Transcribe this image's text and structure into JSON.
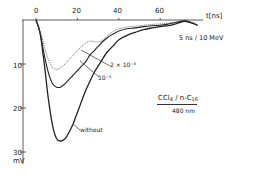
{
  "chart_data": {
    "type": "line",
    "title": "",
    "xlabel": "t[ns]",
    "ylabel": "mV",
    "x_ticks": [
      "0",
      "20",
      "40",
      "60"
    ],
    "y_ticks": [
      "10",
      "20",
      "30"
    ],
    "xlim": [
      -3,
      100
    ],
    "ylim": [
      0,
      31
    ],
    "y_inverted": true,
    "grid": false,
    "annotations": {
      "scale": "5 ns / 10 MeV",
      "system_line1": "CCl4 / n-C16",
      "system_line2": "480 nm"
    },
    "series": [
      {
        "name": "without",
        "style": "solid-thick",
        "x": [
          0,
          2,
          4,
          6,
          8,
          10,
          12,
          14,
          16,
          18,
          20,
          22,
          24,
          26,
          28,
          30,
          32,
          34,
          36,
          38,
          40,
          44,
          48,
          52,
          56,
          60,
          64,
          68,
          72,
          76,
          78
        ],
        "y": [
          0,
          3,
          10,
          18,
          24,
          27,
          27.5,
          27,
          25.5,
          23.5,
          21,
          18.5,
          16,
          14,
          12,
          10.5,
          9,
          7.5,
          6.5,
          5.5,
          4.5,
          3.5,
          2.8,
          2.2,
          1.8,
          1.5,
          1.3,
          0.8,
          0.3,
          0.8,
          1.2
        ]
      },
      {
        "name": "10^-3",
        "style": "solid",
        "x": [
          0,
          2,
          4,
          6,
          8,
          10,
          12,
          14,
          16,
          18,
          20,
          22,
          24,
          26,
          28,
          30,
          32,
          34,
          36,
          38,
          40,
          44,
          48,
          52,
          56,
          60,
          64,
          68,
          72,
          76,
          78
        ],
        "y": [
          0,
          3,
          8,
          12,
          14.5,
          15.3,
          15.2,
          14.5,
          13.5,
          12.5,
          11.5,
          10.5,
          9.5,
          8,
          7,
          6,
          5,
          4.2,
          3.5,
          3,
          2.5,
          2,
          1.8,
          1.5,
          1.3,
          1.2,
          0.9,
          0.5,
          0.2,
          0.8,
          1.2
        ]
      },
      {
        "name": "2 x 10^-3",
        "style": "dotted",
        "x": [
          0,
          2,
          4,
          6,
          8,
          10,
          12,
          14,
          16,
          18,
          20,
          22,
          24,
          26,
          28,
          30,
          32,
          34,
          36,
          38,
          40,
          44,
          48,
          52,
          56,
          60,
          64,
          68,
          72,
          76,
          78
        ],
        "y": [
          0,
          2.5,
          6,
          9,
          10.8,
          11.2,
          10.8,
          10,
          9,
          8,
          7,
          6,
          5.3,
          4.8,
          4.9,
          5,
          4.6,
          3.8,
          3,
          2.4,
          2,
          1.6,
          1.4,
          1.2,
          1,
          0.9,
          0.7,
          0.4,
          0.1,
          0.6,
          1
        ]
      }
    ],
    "curve_labels": [
      "2 × 10⁻³",
      "10⁻³",
      "without"
    ]
  }
}
